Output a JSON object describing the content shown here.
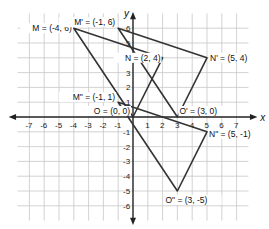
{
  "diagram": {
    "type": "coordinate-plane",
    "origin_px": [
      133,
      117
    ],
    "unit_px": 14.8,
    "x_range": [
      -8,
      8
    ],
    "y_range": [
      -7,
      7
    ],
    "axes": {
      "x_label": "x",
      "y_label": "y"
    },
    "x_ticks": [
      -7,
      -6,
      -5,
      -4,
      -3,
      -2,
      -1,
      1,
      2,
      3,
      4,
      5,
      6,
      7
    ],
    "y_ticks": [
      6,
      5,
      4,
      3,
      2,
      1,
      -1,
      -2,
      -3,
      -4,
      -5,
      -6
    ],
    "colors": {
      "grid": "#c8c8c8",
      "axis": "#222222",
      "triangle": "#333333"
    },
    "triangles": [
      {
        "name": "MNO",
        "vertices": [
          {
            "name": "M",
            "x": -4,
            "y": 6,
            "label": "M = (-4, 6)"
          },
          {
            "name": "N",
            "x": 2,
            "y": 4,
            "label": "N = (2, 4)"
          },
          {
            "name": "O",
            "x": 0,
            "y": 0,
            "label": "O = (0, 0)"
          }
        ]
      },
      {
        "name": "M'N'O'",
        "vertices": [
          {
            "name": "M'",
            "x": -1,
            "y": 6,
            "label": "M' = (-1, 6)"
          },
          {
            "name": "N'",
            "x": 5,
            "y": 4,
            "label": "N' = (5, 4)"
          },
          {
            "name": "O'",
            "x": 3,
            "y": 0,
            "label": "O' = (3, 0)"
          }
        ]
      },
      {
        "name": "M''N''O''",
        "vertices": [
          {
            "name": "M''",
            "x": -1,
            "y": 1,
            "label": "M\" = (-1, 1)"
          },
          {
            "name": "N''",
            "x": 5,
            "y": -1,
            "label": "N\" = (5, -1)"
          },
          {
            "name": "O''",
            "x": 3,
            "y": -5,
            "label": "O\" = (3, -5)"
          }
        ]
      }
    ]
  }
}
